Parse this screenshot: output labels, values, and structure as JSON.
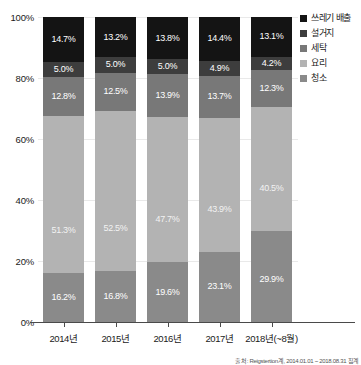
{
  "chart_data": {
    "type": "bar",
    "subtype": "stacked-percent",
    "title": "",
    "xlabel": "",
    "ylabel": "",
    "ylim": [
      0,
      100
    ],
    "ytick_labels": [
      "0%",
      "20%",
      "40%",
      "60%",
      "80%",
      "100%"
    ],
    "ytick_values": [
      0,
      20,
      40,
      60,
      80,
      100
    ],
    "grid": true,
    "legend_position": "right-top",
    "categories": [
      "2014년",
      "2015년",
      "2016년",
      "2017년",
      "2018년(~8월)"
    ],
    "series": [
      {
        "name": "청소",
        "color": "#8a8a8a",
        "values": [
          16.2,
          16.8,
          19.6,
          23.1,
          29.9
        ],
        "labels": [
          "16.2%",
          "16.8%",
          "19.6%",
          "23.1%",
          "29.9%"
        ]
      },
      {
        "name": "요리",
        "color": "#b3b3b3",
        "values": [
          51.3,
          52.5,
          47.7,
          43.9,
          40.5
        ],
        "labels": [
          "51.3%",
          "52.5%",
          "47.7%",
          "43.9%",
          "40.5%"
        ]
      },
      {
        "name": "세탁",
        "color": "#787878",
        "values": [
          12.8,
          12.5,
          13.9,
          13.7,
          12.3
        ],
        "labels": [
          "12.8%",
          "12.5%",
          "13.9%",
          "13.7%",
          "12.3%"
        ]
      },
      {
        "name": "설거지",
        "color": "#3d3d3d",
        "values": [
          5.0,
          5.0,
          5.0,
          4.9,
          4.2
        ],
        "labels": [
          "5.0%",
          "5.0%",
          "5.0%",
          "4.9%",
          "4.2%"
        ]
      },
      {
        "name": "쓰레기 배출",
        "color": "#141414",
        "values": [
          14.7,
          13.2,
          13.8,
          14.4,
          13.1
        ],
        "labels": [
          "14.7%",
          "13.2%",
          "13.8%",
          "14.4%",
          "13.1%"
        ]
      }
    ],
    "legend": [
      {
        "label": "쓰레기 배출",
        "color": "#141414"
      },
      {
        "label": "설거지",
        "color": "#3d3d3d"
      },
      {
        "label": "세탁",
        "color": "#787878"
      },
      {
        "label": "요리",
        "color": "#b3b3b3"
      },
      {
        "label": "청소",
        "color": "#8a8a8a"
      }
    ],
    "source_note": "출처: Reigstertion계, 2014.01.01 ~ 2018.08.31 집계"
  }
}
